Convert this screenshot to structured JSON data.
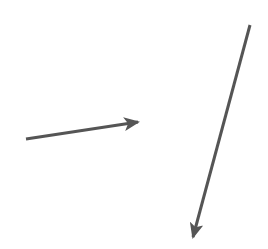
{
  "diagram": {
    "background": "#ffffff",
    "stroke_color": "#555555",
    "arrows": [
      {
        "name": "arrow-right",
        "x1": 26,
        "y1": 139,
        "x2": 138,
        "y2": 122
      },
      {
        "name": "arrow-down",
        "x1": 250,
        "y1": 25,
        "x2": 193,
        "y2": 237
      }
    ]
  }
}
